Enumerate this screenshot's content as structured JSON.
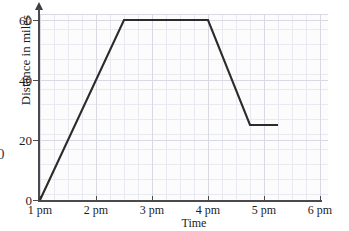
{
  "chart_data": {
    "type": "line",
    "title": "",
    "xlabel": "Time",
    "ylabel": "Distance in miles",
    "xlim": [
      1,
      6.5
    ],
    "ylim": [
      0,
      63
    ],
    "grid": true,
    "legend": "none",
    "x_tick_labels": [
      "1 pm",
      "2 pm",
      "3 pm",
      "4 pm",
      "5 pm",
      "6 pm"
    ],
    "x_tick_values": [
      1,
      2,
      3,
      4,
      5,
      6
    ],
    "y_tick_labels": [
      "0",
      "20",
      "40",
      "60"
    ],
    "y_tick_values": [
      0,
      20,
      40,
      60
    ],
    "series": [
      {
        "name": "Distance travelled",
        "color": "#2b2b2b",
        "x": [
          1,
          2.5,
          4,
          4.75,
          5.25
        ],
        "y": [
          0,
          60,
          60,
          25,
          25
        ],
        "points": [
          {
            "time": "1 pm",
            "distance": 0
          },
          {
            "time": "2:30 pm",
            "distance": 60
          },
          {
            "time": "4 pm",
            "distance": 60
          },
          {
            "time": "4:45 pm",
            "distance": 25
          },
          {
            "time": "5:15 pm",
            "distance": 25
          }
        ]
      }
    ],
    "annotations": [],
    "clipped_text_left": "0"
  },
  "axis": {
    "y_title": "Distance in miles",
    "x_title": "Time"
  },
  "colors": {
    "line": "#2b2b2b",
    "axis": "#4a4a4a",
    "grid_minor": "#e9e9f1",
    "grid_major": "#d9d9e6",
    "plot_background": "#fcfcfd",
    "text": "#1d1d1d"
  }
}
